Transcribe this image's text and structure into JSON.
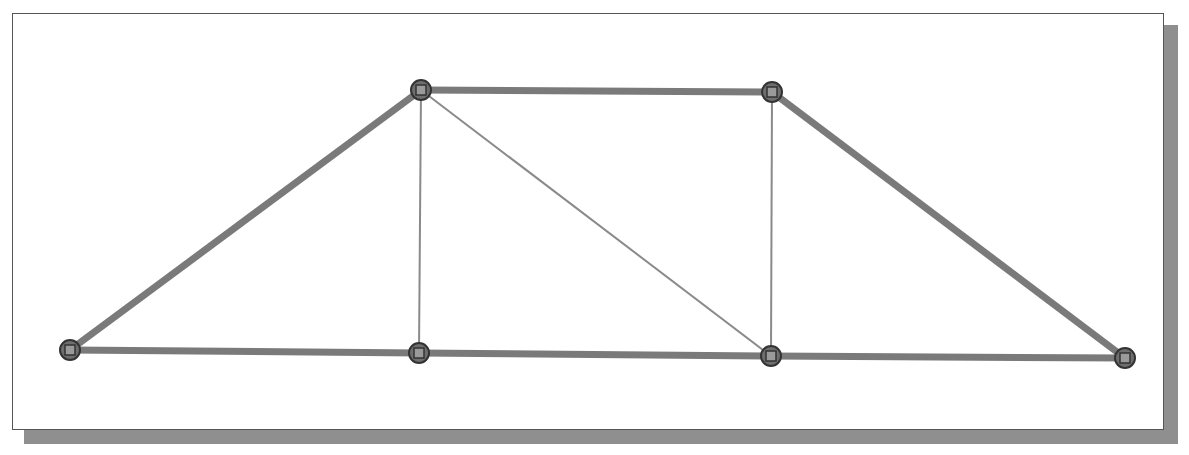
{
  "diagram": {
    "type": "truss",
    "colors": {
      "chord": "#7a7a7a",
      "web": "#8a8a8a",
      "node_fill": "#6e6e6e",
      "node_stroke": "#333333",
      "node_inner": "#9a9a9a"
    },
    "nodes": [
      {
        "id": "n1",
        "x": 70,
        "y": 350
      },
      {
        "id": "n2",
        "x": 421,
        "y": 90
      },
      {
        "id": "n3",
        "x": 772,
        "y": 92
      },
      {
        "id": "n4",
        "x": 419,
        "y": 353
      },
      {
        "id": "n5",
        "x": 771,
        "y": 356
      },
      {
        "id": "n6",
        "x": 1125,
        "y": 358
      }
    ],
    "members": [
      {
        "from": "n1",
        "to": "n2",
        "kind": "chord"
      },
      {
        "from": "n2",
        "to": "n3",
        "kind": "chord"
      },
      {
        "from": "n3",
        "to": "n6",
        "kind": "chord"
      },
      {
        "from": "n1",
        "to": "n4",
        "kind": "chord"
      },
      {
        "from": "n4",
        "to": "n5",
        "kind": "chord"
      },
      {
        "from": "n5",
        "to": "n6",
        "kind": "chord"
      },
      {
        "from": "n2",
        "to": "n4",
        "kind": "web"
      },
      {
        "from": "n2",
        "to": "n5",
        "kind": "web"
      },
      {
        "from": "n3",
        "to": "n5",
        "kind": "web"
      }
    ]
  }
}
